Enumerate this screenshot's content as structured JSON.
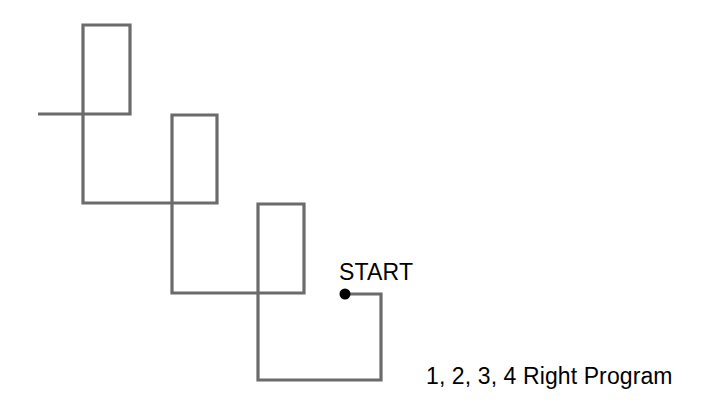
{
  "figure": {
    "title": "1, 2, 3, 4 Right Program",
    "background_color": "#ffffff",
    "width": 712,
    "height": 413
  },
  "drawing": {
    "stroke_color": "#6b6b6b",
    "stroke_width": 3.2,
    "marker_color": "#000000",
    "description": "Continuous open polyline forming a descending staircase of three tall vertical rectangles",
    "start_marker": {
      "name": "start-dot",
      "x": 345,
      "y": 294,
      "radius": 5.5
    },
    "points": [
      [
        345,
        294
      ],
      [
        381,
        294
      ],
      [
        381,
        380
      ],
      [
        258,
        380
      ],
      [
        258,
        204
      ],
      [
        304,
        204
      ],
      [
        304,
        293
      ],
      [
        172,
        293
      ],
      [
        172,
        115
      ],
      [
        217,
        115
      ],
      [
        217,
        203
      ],
      [
        83,
        203
      ],
      [
        83,
        25
      ],
      [
        130,
        25
      ],
      [
        130,
        114
      ],
      [
        38,
        114
      ]
    ]
  },
  "labels": {
    "start": "START",
    "caption": "1, 2, 3, 4 Right Program"
  }
}
